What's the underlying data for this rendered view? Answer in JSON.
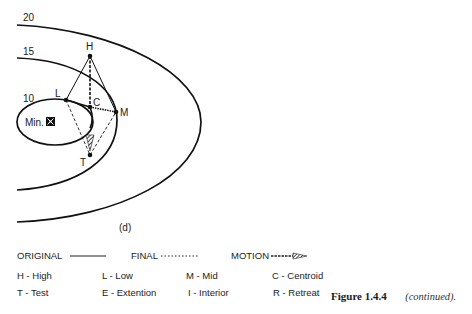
{
  "diagram": {
    "panel_label": "(d)",
    "contours": [
      {
        "label": "20"
      },
      {
        "label": "15"
      },
      {
        "label": "10"
      }
    ],
    "minimum_label": "Min.",
    "minimum_icon": "crossed-box-icon",
    "points": {
      "H": "H",
      "L": "L",
      "C": "C",
      "M": "M",
      "T": "T"
    }
  },
  "legend": {
    "line_styles": [
      {
        "label": "ORIGINAL",
        "style": "solid"
      },
      {
        "label": "FINAL",
        "style": "dotted"
      },
      {
        "label": "MOTION",
        "style": "hatched-arrow"
      }
    ],
    "keys_row1": [
      "H -  High",
      "L - Low",
      "M - Mid",
      "C - Centroid"
    ],
    "keys_row2": [
      "T - Test",
      "E - Extention",
      "I - Interior",
      "R - Retreat"
    ]
  },
  "caption": {
    "figure": "Figure 1.4.4",
    "note": "(continued)."
  }
}
